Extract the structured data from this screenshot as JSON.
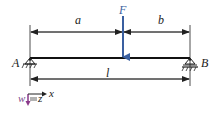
{
  "diagram": {
    "type": "simply-supported-beam",
    "labels": {
      "a": "a",
      "b": "b",
      "force": "F",
      "support_left": "A",
      "support_right": "B",
      "length": "l"
    },
    "axes": {
      "x": "x",
      "z": "z",
      "w": "w"
    },
    "colors": {
      "beam": "#111111",
      "force": "#3a5fa0",
      "w_arrow": "#8a3a8a",
      "lines": "#222222"
    }
  }
}
